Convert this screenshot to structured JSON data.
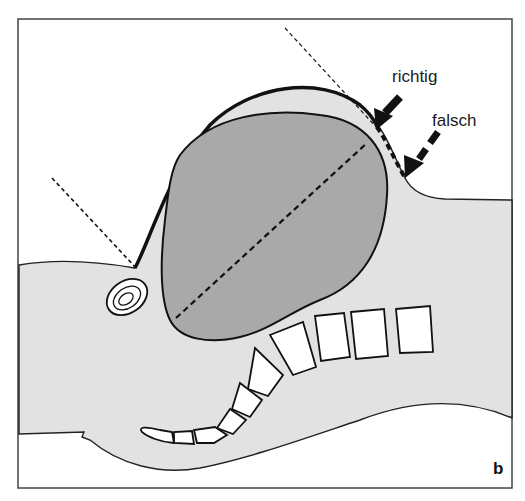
{
  "figure": {
    "panel_letter": "b",
    "annotations": {
      "correct_label": "richtig",
      "wrong_label": "falsch"
    },
    "colors": {
      "frame": "#444444",
      "body_fill": "#e2e2e2",
      "brain_fill": "#a9a9a9",
      "outline": "#111111",
      "vertebra_fill": "#ffffff",
      "background": "#ffffff"
    }
  }
}
